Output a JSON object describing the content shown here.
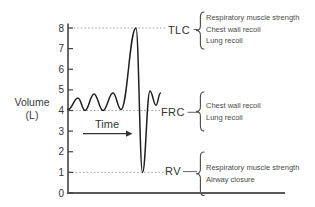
{
  "colors": {
    "background": "#ffffff",
    "ink": "#3a3a3a",
    "axis": "#444444",
    "trace": "#1f1f1f",
    "leader": "#9b9b9b"
  },
  "chart_data": {
    "type": "line",
    "title": "",
    "xlabel": "Time",
    "ylabel_line1": "Volume",
    "ylabel_line2": "(L)",
    "ylim": [
      0,
      8
    ],
    "y_ticks": [
      8,
      7,
      6,
      5,
      4,
      3,
      2,
      1,
      0
    ],
    "grid": false,
    "series": [
      {
        "name": "lung-volume-spirogram-trace",
        "points": [
          {
            "t": 0,
            "v": 4.05
          },
          {
            "t": 10,
            "v": 4.6
          },
          {
            "t": 17,
            "v": 4.0
          },
          {
            "t": 26,
            "v": 4.8
          },
          {
            "t": 35,
            "v": 4.0
          },
          {
            "t": 45,
            "v": 4.85
          },
          {
            "t": 53,
            "v": 4.05
          },
          {
            "t": 68,
            "v": 8.0
          },
          {
            "t": 74.5,
            "v": 1.0
          },
          {
            "t": 82,
            "v": 4.95
          },
          {
            "t": 88,
            "v": 4.25
          },
          {
            "t": 92.5,
            "v": 4.85
          }
        ]
      }
    ],
    "reference_lines": [
      {
        "abbr": "TLC",
        "volume": 8,
        "determinants": [
          "Respiratory muscle strength",
          "Chest wall recoil",
          "Lung recoil"
        ]
      },
      {
        "abbr": "FRC",
        "volume": 4,
        "determinants": [
          "Chest wall recoil",
          "Lung recoil"
        ]
      },
      {
        "abbr": "RV",
        "volume": 1,
        "determinants": [
          "Respiratory muscle strength",
          "Airway closure"
        ]
      }
    ]
  }
}
